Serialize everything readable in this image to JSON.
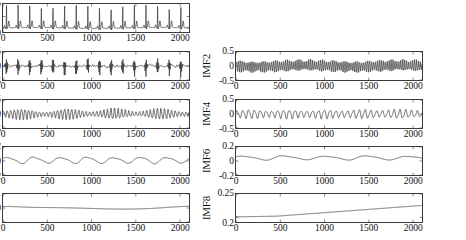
{
  "figure": {
    "title": "",
    "columns": 2,
    "rows": 4
  },
  "chart_data": [
    {
      "type": "line",
      "title": "Signal",
      "ylabel": "Signal",
      "xlabel": "",
      "xlim": [
        0,
        2100
      ],
      "ylim": [
        -0.18,
        1.05
      ],
      "yticks": [
        0.5,
        0
      ],
      "ytick_labels": [
        "0.5",
        "0"
      ],
      "xticks": [
        0,
        500,
        1000,
        1500,
        2000
      ],
      "xtick_labels": [
        "0",
        "500",
        "1000",
        "1500",
        "2000"
      ],
      "grid": false,
      "color": "#333333",
      "description": "Raw ECG-like signal with ~16 periodic QRS spikes reaching about 1.0, baseline near 0 with small P and T waves.",
      "waveform": "ecg",
      "cycles": 16,
      "peak": 1.0,
      "baseline": 0.0
    },
    {
      "type": "line",
      "title": "IMF2",
      "ylabel": "IMF2",
      "xlabel": "",
      "xlim": [
        0,
        2100
      ],
      "ylim": [
        -0.5,
        0.5
      ],
      "yticks": [
        0.5,
        0,
        -0.5
      ],
      "ytick_labels": [
        "0.5",
        "0",
        "-0.5"
      ],
      "xticks": [
        0,
        500,
        1000,
        1500,
        2000
      ],
      "xtick_labels": [
        "0",
        "500",
        "1000",
        "1500",
        "2000"
      ],
      "grid": false,
      "color": "#333333",
      "description": "Dense oscillation of moderate frequency, amplitude roughly +/-0.2 across the full record.",
      "waveform": "osc",
      "cycles": 95,
      "amplitude": 0.2,
      "modulation": 0.35,
      "mod_cycles": 16
    },
    {
      "type": "line",
      "title": "IMF1",
      "ylabel": "IMF1",
      "xlabel": "",
      "xlim": [
        0,
        2100
      ],
      "ylim": [
        -0.5,
        0.5
      ],
      "yticks": [
        0.5,
        0,
        -0.5
      ],
      "ytick_labels": [
        "0.5",
        "0",
        "-0.5"
      ],
      "xticks": [
        0,
        500,
        1000,
        1500,
        2000
      ],
      "xtick_labels": [
        "0",
        "500",
        "1000",
        "1500",
        "2000"
      ],
      "grid": false,
      "color": "#333333",
      "description": "Highest frequency component: low-amplitude noise punctuated by periodic bursts up to about +/-0.25 aligned with the QRS spikes.",
      "waveform": "burst",
      "cycles": 230,
      "amplitude": 0.07,
      "burst_amplitude": 0.28,
      "bursts": 16
    },
    {
      "type": "line",
      "title": "IMF4",
      "ylabel": "IMF4",
      "xlabel": "",
      "xlim": [
        0,
        2100
      ],
      "ylim": [
        -0.5,
        0.5
      ],
      "yticks": [
        0.5,
        0,
        -0.5
      ],
      "ytick_labels": [
        "0.5",
        "0",
        "-0.5"
      ],
      "xticks": [
        0,
        500,
        1000,
        1500,
        2000
      ],
      "xtick_labels": [
        "0",
        "500",
        "1000",
        "1500",
        "2000"
      ],
      "grid": false,
      "color": "#333333",
      "description": "Regular oscillation, about 32 cycles, amplitude near +/-0.15 with mild amplitude modulation.",
      "waveform": "osc",
      "cycles": 32,
      "amplitude": 0.15,
      "modulation": 0.3,
      "mod_cycles": 5
    },
    {
      "type": "line",
      "title": "IMF3",
      "ylabel": "IMF3",
      "xlabel": "",
      "xlim": [
        0,
        2100
      ],
      "ylim": [
        -0.5,
        0.5
      ],
      "yticks": [
        0.5,
        0,
        -0.5
      ],
      "ytick_labels": [
        "0.5",
        "0",
        "-0.5"
      ],
      "xticks": [
        0,
        500,
        1000,
        1500,
        2000
      ],
      "xtick_labels": [
        "0",
        "500",
        "1000",
        "1500",
        "2000"
      ],
      "grid": false,
      "color": "#333333",
      "description": "Amplitude-modulated oscillation in beats: groups of larger swings near +/-0.22 alternating with quieter intervals.",
      "waveform": "osc",
      "cycles": 52,
      "amplitude": 0.18,
      "modulation": 0.6,
      "mod_cycles": 4
    },
    {
      "type": "line",
      "title": "IMF6",
      "ylabel": "IMF6",
      "xlabel": "",
      "xlim": [
        0,
        2100
      ],
      "ylim": [
        -0.2,
        0.2
      ],
      "yticks": [
        0.2,
        0,
        -0.2
      ],
      "ytick_labels": [
        "0.2",
        "0",
        "-0.2"
      ],
      "xticks": [
        0,
        500,
        1000,
        1500,
        2000
      ],
      "xtick_labels": [
        "0",
        "500",
        "1000",
        "1500",
        "2000"
      ],
      "grid": false,
      "color": "#333333",
      "description": "Slow low-amplitude wave hovering just above zero, about 4 gentle undulations with amplitude near 0.03.",
      "waveform": "osc",
      "cycles": 4.5,
      "amplitude": 0.03,
      "offset": 0.045,
      "modulation": 0.25,
      "mod_cycles": 2
    },
    {
      "type": "line",
      "title": "IMF5",
      "ylabel": "IMF5",
      "xlabel": "",
      "xlim": [
        0,
        2100
      ],
      "ylim": [
        -0.2,
        0.2
      ],
      "yticks": [
        0.2,
        0,
        -0.2
      ],
      "ytick_labels": [
        "0.2",
        "0",
        "-0.2"
      ],
      "xticks": [
        0,
        500,
        1000,
        1500,
        2000
      ],
      "xtick_labels": [
        "0",
        "500",
        "1000",
        "1500",
        "2000"
      ],
      "grid": false,
      "color": "#333333",
      "description": "Smooth oscillation of about 7 cycles with amplitude around 0.04 centred slightly above zero.",
      "waveform": "osc",
      "cycles": 7,
      "amplitude": 0.045,
      "offset": 0.012,
      "modulation": 0.2,
      "mod_cycles": 3
    },
    {
      "type": "line",
      "title": "IMF8",
      "ylabel": "IMF8",
      "xlabel": "",
      "xlim": [
        0,
        2100
      ],
      "ylim": [
        0.19,
        0.25
      ],
      "yticks": [
        0.25,
        0.2
      ],
      "ytick_labels": [
        "0.25",
        "0.2"
      ],
      "xticks": [
        0,
        500,
        1000,
        1500,
        2000
      ],
      "xtick_labels": [
        "0",
        "500",
        "1000",
        "1500",
        "2000"
      ],
      "grid": false,
      "color": "#333333",
      "description": "Monotonic residual trend: flat near 0.201 until about x=500 then rising steadily to roughly 0.225 at the end.",
      "waveform": "trend",
      "start": 0.201,
      "end": 0.2255,
      "knee": 0.22
    },
    {
      "type": "line",
      "title": "IMF7",
      "ylabel": "IMF7",
      "xlabel": "",
      "xlim": [
        0,
        2100
      ],
      "ylim": [
        -0.1,
        0.1
      ],
      "yticks": [
        0.1,
        0,
        -0.1
      ],
      "ytick_labels": [
        "0.1",
        "0",
        "-0.1"
      ],
      "xticks": [
        0,
        500,
        1000,
        1500,
        2000
      ],
      "xtick_labels": [
        "0",
        "500",
        "1000",
        "1500",
        "2000"
      ],
      "grid": false,
      "color": "#333333",
      "description": "Nearly flat trace close to zero with a shallow broad dip centred near x=1400 and a slight rise at both ends.",
      "waveform": "dip",
      "amplitude": 0.012,
      "dip_center": 0.66,
      "offset": 0.004
    }
  ],
  "panels": [
    {
      "key": "signal",
      "label": "Signal",
      "index": 0,
      "col": 0,
      "row": 0
    },
    {
      "key": "imf2",
      "label": "IMF2",
      "index": 1,
      "col": 1,
      "row": 0
    },
    {
      "key": "imf1",
      "label": "IMF1",
      "index": 2,
      "col": 0,
      "row": 1
    },
    {
      "key": "imf4",
      "label": "IMF4",
      "index": 3,
      "col": 1,
      "row": 1
    },
    {
      "key": "imf3",
      "label": "IMF3",
      "index": 4,
      "col": 0,
      "row": 2
    },
    {
      "key": "imf6",
      "label": "IMF6",
      "index": 5,
      "col": 1,
      "row": 2
    },
    {
      "key": "imf5",
      "label": "IMF5",
      "index": 6,
      "col": 0,
      "row": 3
    },
    {
      "key": "imf8",
      "label": "IMF8",
      "index": 7,
      "col": 1,
      "row": 3
    },
    {
      "key": "imf7",
      "label": "IMF7",
      "index": 8,
      "col": 0,
      "row": 4
    }
  ]
}
